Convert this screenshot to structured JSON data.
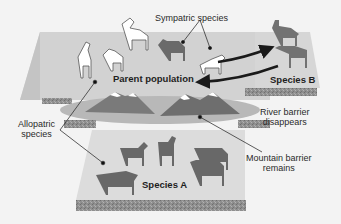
{
  "diagram": {
    "type": "speciation-illustration",
    "labels": {
      "sympatric": "Sympatric species",
      "parent_population": "Parent population",
      "species_b": "Species B",
      "river_barrier_line1": "River barrier",
      "river_barrier_line2": "disappears",
      "allopatric_line1": "Allopatric",
      "allopatric_line2": "species",
      "mountain_line1": "Mountain barrier",
      "mountain_line2": "remains",
      "species_a": "Species A"
    },
    "regions": [
      {
        "name": "parent-population-platform",
        "animals": 5,
        "animal_style": "white horses"
      },
      {
        "name": "species-b-platform",
        "animals": 2,
        "animal_style": "gray horses"
      },
      {
        "name": "species-a-platform",
        "animals": 5,
        "animal_style": "gray zebra-like equids"
      }
    ],
    "colors": {
      "background": "#f3f3f3",
      "platform": "#d0d0d0",
      "platform_light": "#e2e2e2",
      "strip": "#8a8a8a",
      "mountain": "#7a7a7a",
      "animal_gray": "#6a6a6a",
      "arrow": "#1a1a1a"
    }
  }
}
